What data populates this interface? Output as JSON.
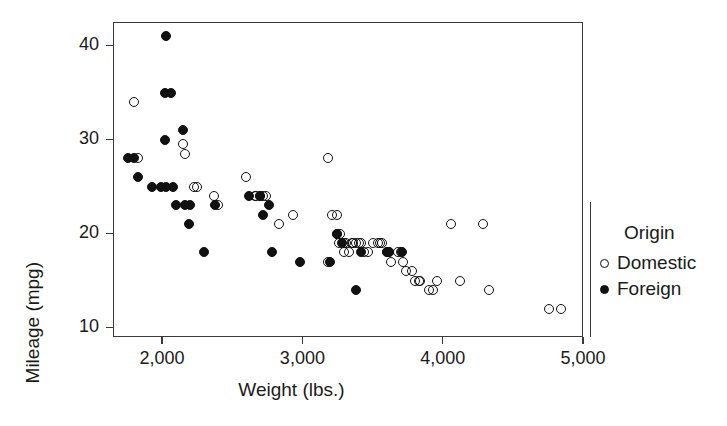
{
  "chart_data": {
    "type": "scatter",
    "title": "",
    "xlabel": "Weight (lbs.)",
    "ylabel": "Mileage (mpg)",
    "xlim": [
      1650,
      5000
    ],
    "ylim": [
      9.0,
      42.5
    ],
    "xticks": [
      2000,
      3000,
      4000,
      5000
    ],
    "xtick_labels": [
      "2,000",
      "3,000",
      "4,000",
      "5,000"
    ],
    "yticks": [
      10,
      20,
      30,
      40
    ],
    "ytick_labels": [
      "10",
      "20",
      "30",
      "40"
    ],
    "grid": false,
    "legend": {
      "title": "Origin",
      "position": "right",
      "entries": [
        {
          "label": "Domestic",
          "marker": "open-circle"
        },
        {
          "label": "Foreign",
          "marker": "filled-circle"
        }
      ]
    },
    "series": [
      {
        "name": "Domestic",
        "marker": "open-circle",
        "points": [
          [
            1800,
            34
          ],
          [
            1830,
            28
          ],
          [
            2150,
            29.5
          ],
          [
            2160,
            28.5
          ],
          [
            2230,
            25
          ],
          [
            2250,
            25
          ],
          [
            2370,
            24
          ],
          [
            2400,
            23
          ],
          [
            2600,
            26
          ],
          [
            2660,
            24
          ],
          [
            2670,
            24
          ],
          [
            2700,
            24
          ],
          [
            2720,
            24
          ],
          [
            2740,
            24
          ],
          [
            2830,
            21
          ],
          [
            2930,
            22
          ],
          [
            3180,
            28
          ],
          [
            3210,
            22
          ],
          [
            3250,
            22
          ],
          [
            3260,
            19
          ],
          [
            3250,
            20
          ],
          [
            3270,
            20
          ],
          [
            3180,
            17
          ],
          [
            3300,
            19
          ],
          [
            3310,
            19
          ],
          [
            3350,
            19
          ],
          [
            3360,
            19
          ],
          [
            3380,
            19
          ],
          [
            3400,
            19
          ],
          [
            3420,
            19
          ],
          [
            3300,
            18
          ],
          [
            3330,
            18
          ],
          [
            3440,
            18
          ],
          [
            3470,
            18
          ],
          [
            3500,
            19
          ],
          [
            3540,
            19
          ],
          [
            3550,
            19
          ],
          [
            3570,
            19
          ],
          [
            3600,
            18
          ],
          [
            3620,
            18
          ],
          [
            3630,
            17
          ],
          [
            3680,
            18
          ],
          [
            3700,
            18
          ],
          [
            3720,
            17
          ],
          [
            3740,
            16
          ],
          [
            3780,
            16
          ],
          [
            3800,
            15
          ],
          [
            3830,
            15
          ],
          [
            3840,
            15
          ],
          [
            3900,
            14
          ],
          [
            3930,
            14
          ],
          [
            3960,
            15
          ],
          [
            4060,
            21
          ],
          [
            4120,
            15
          ],
          [
            4290,
            21
          ],
          [
            4330,
            14
          ],
          [
            4760,
            12
          ],
          [
            4840,
            12
          ]
        ]
      },
      {
        "name": "Foreign",
        "marker": "filled-circle",
        "points": [
          [
            2030,
            41
          ],
          [
            2020,
            35
          ],
          [
            2060,
            35
          ],
          [
            1760,
            28
          ],
          [
            1800,
            28
          ],
          [
            1830,
            26
          ],
          [
            1930,
            25
          ],
          [
            1990,
            25
          ],
          [
            2030,
            25
          ],
          [
            2020,
            30
          ],
          [
            2150,
            31
          ],
          [
            2100,
            23
          ],
          [
            2160,
            23
          ],
          [
            2200,
            23
          ],
          [
            2190,
            21
          ],
          [
            2300,
            18
          ],
          [
            2380,
            23
          ],
          [
            2700,
            24
          ],
          [
            2760,
            23
          ],
          [
            2720,
            22
          ],
          [
            2620,
            24
          ],
          [
            2780,
            18
          ],
          [
            2980,
            17
          ],
          [
            3200,
            17
          ],
          [
            3380,
            14
          ],
          [
            3420,
            18
          ],
          [
            3280,
            19
          ],
          [
            3250,
            20
          ],
          [
            3600,
            18
          ],
          [
            3620,
            18
          ],
          [
            3710,
            18
          ],
          [
            2080,
            25
          ]
        ]
      }
    ]
  },
  "geometry": {
    "plot_left_px": 113,
    "plot_top_px": 22,
    "plot_right_px": 583,
    "plot_bottom_px": 337
  }
}
